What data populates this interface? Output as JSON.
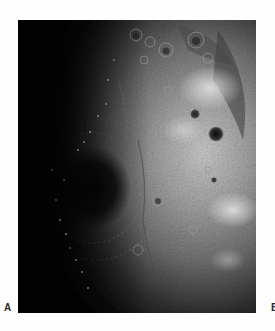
{
  "figure": {
    "panels": [
      {
        "label": "A",
        "subject": "lunar surface photograph",
        "description": "Grayscale image of the Moon showing a large multi-ring impact basin near the terminator, cratered highlands, and the curved limb at right",
        "colors": {
          "background": "#020202",
          "shadow": "#0a0a0a",
          "midtone": "#6e6e6e",
          "highlight": "#cfcfcf"
        }
      },
      {
        "label": "B",
        "subject": "adjacent panel (cropped out of view)"
      }
    ]
  }
}
